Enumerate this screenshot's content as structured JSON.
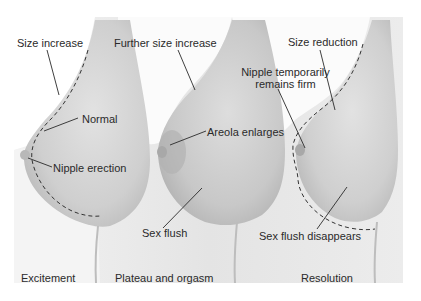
{
  "figure": {
    "panels": [
      {
        "stage": "Excitement",
        "labels": [
          "Size increase",
          "Normal",
          "Nipple erection"
        ]
      },
      {
        "stage": "Plateau and orgasm",
        "labels": [
          "Further size increase",
          "Areola enlarges",
          "Sex flush"
        ]
      },
      {
        "stage": "Resolution",
        "labels": [
          "Size reduction",
          "Nipple temporarily",
          "remains firm",
          "Sex flush disappears"
        ]
      }
    ],
    "colors": {
      "background": "#ffffff",
      "panel": "#e6e6e6",
      "skin_shade": "#c9c9c9",
      "areola": "#b5b5b5",
      "line": "#2a2a2a"
    }
  }
}
